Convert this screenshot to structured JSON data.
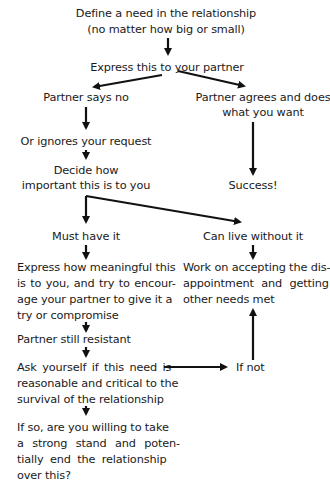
{
  "flowchart": {
    "start": {
      "line1": "Define a need in the relationship",
      "line2": "(no matter how big or small)"
    },
    "express": "Express this to your partner",
    "no_branch": {
      "says_no": "Partner says no",
      "ignores": "Or ignores your request",
      "decide_line1": "Decide how",
      "decide_line2": "important this is to you"
    },
    "yes_branch": {
      "agrees_line1": "Partner agrees and does",
      "agrees_line2": "what you want",
      "success": "Success!"
    },
    "must_have": {
      "label": "Must have it",
      "express_meaning": [
        "Express how meaningful this",
        "is to you, and try to encour-",
        "age your partner to give it a",
        "try or compromise"
      ],
      "still_resistant": "Partner still resistant",
      "ask_yourself": [
        "Ask yourself if this need is",
        "reasonable and critical to the",
        "survival of the relationship"
      ],
      "if_so": [
        "If so, are you willing to take",
        "a strong stand and poten-",
        "tially end the relationship",
        "over this?"
      ]
    },
    "can_live": {
      "label": "Can live without it",
      "work_on": [
        "Work on accepting the dis-",
        "appointment and getting",
        "other needs met"
      ],
      "if_not": "If not"
    }
  },
  "colors": {
    "text": "#1a1a1a",
    "arrows": "#111111",
    "background": "#ffffff"
  }
}
